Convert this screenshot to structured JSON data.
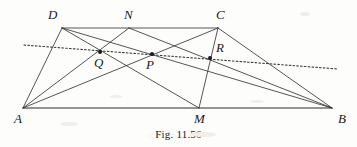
{
  "figure": {
    "caption": "Fig. 11.56",
    "line_color": "#2b2b2b",
    "dotted_color": "#3a3a3a",
    "background": "#fdfdfc",
    "width": 357,
    "height": 147
  },
  "points": {
    "A": {
      "label": "A",
      "x": 23,
      "y": 108,
      "label_x": 14,
      "label_y": 112,
      "dot": false
    },
    "B": {
      "label": "B",
      "x": 332,
      "y": 108,
      "label_x": 338,
      "label_y": 112,
      "dot": false
    },
    "C": {
      "label": "C",
      "x": 218,
      "y": 28,
      "label_x": 216,
      "label_y": 8,
      "dot": false
    },
    "D": {
      "label": "D",
      "x": 62,
      "y": 28,
      "label_x": 48,
      "label_y": 8,
      "dot": false
    },
    "N": {
      "label": "N",
      "x": 129,
      "y": 28,
      "label_x": 124,
      "label_y": 8,
      "dot": false
    },
    "M": {
      "label": "M",
      "x": 199,
      "y": 108,
      "label_x": 194,
      "label_y": 112,
      "dot": false
    },
    "P": {
      "label": "P",
      "x": 152,
      "y": 54,
      "label_x": 146,
      "label_y": 58,
      "dot": true
    },
    "Q": {
      "label": "Q",
      "x": 100,
      "y": 52,
      "label_x": 94,
      "label_y": 56,
      "dot": true
    },
    "R": {
      "label": "R",
      "x": 210,
      "y": 58,
      "label_x": 216,
      "label_y": 41,
      "dot": true
    }
  },
  "segments": [
    {
      "name": "side-AD",
      "from": "A",
      "to": "D",
      "style": "solid"
    },
    {
      "name": "top-DC",
      "from": "D",
      "to": "C",
      "style": "solid"
    },
    {
      "name": "side-CB",
      "from": "C",
      "to": "B",
      "style": "solid"
    },
    {
      "name": "base-AB",
      "from": "A",
      "to": "B",
      "style": "base"
    },
    {
      "name": "diagonal-AC",
      "from": "A",
      "to": "C",
      "style": "solid"
    },
    {
      "name": "diagonal-DB",
      "from": "D",
      "to": "B",
      "style": "solid"
    },
    {
      "name": "cevian-AN",
      "from": "A",
      "to": "N",
      "style": "solid"
    },
    {
      "name": "cevian-NB",
      "from": "N",
      "to": "B",
      "style": "solid"
    },
    {
      "name": "cevian-DM",
      "from": "D",
      "to": "M",
      "style": "solid"
    },
    {
      "name": "cevian-CM",
      "from": "C",
      "to": "M",
      "style": "solid"
    }
  ],
  "dotted_line": {
    "name": "transversal-PQR",
    "x1": 24,
    "y1": 45,
    "x2": 338,
    "y2": 69,
    "description": "dotted transversal through Q, P and R"
  },
  "labels_order": [
    "D",
    "N",
    "C",
    "Q",
    "P",
    "R",
    "A",
    "M",
    "B"
  ]
}
